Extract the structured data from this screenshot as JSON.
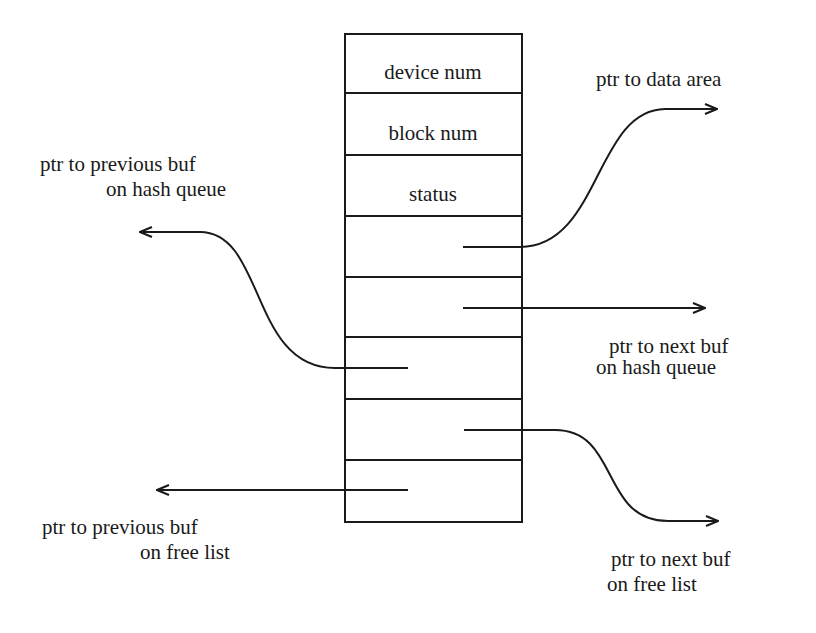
{
  "diagram": {
    "fields": [
      {
        "label": "device num"
      },
      {
        "label": "block num"
      },
      {
        "label": "status"
      },
      {
        "label": ""
      },
      {
        "label": ""
      },
      {
        "label": ""
      },
      {
        "label": ""
      },
      {
        "label": ""
      }
    ],
    "pointers": {
      "data_area": {
        "line1": "ptr to data area"
      },
      "prev_hash": {
        "line1": "ptr to previous buf",
        "line2": "on hash queue"
      },
      "next_hash": {
        "line1": "ptr to next buf",
        "line2": "on hash queue"
      },
      "prev_free": {
        "line1": "ptr to previous buf",
        "line2": "on free list"
      },
      "next_free": {
        "line1": "ptr to next buf",
        "line2": "on free list"
      }
    },
    "colors": {
      "ink": "#1a1a1a",
      "background": "#ffffff"
    }
  }
}
